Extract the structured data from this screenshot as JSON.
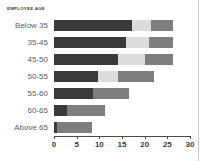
{
  "chart_data": {
    "type": "bar",
    "orientation": "horizontal",
    "stacked": true,
    "title": "EMPLOYEE AGE",
    "xlabel": "",
    "ylabel": "",
    "categories": [
      "Below 35",
      "35-45",
      "45-50",
      "50-55",
      "55-60",
      "60-65",
      "Above 65"
    ],
    "series": [
      {
        "name": "segment-1",
        "color": "#3a3a3a",
        "values": [
          17.1,
          15.8,
          14.2,
          9.8,
          8.7,
          2.9,
          0.7
        ]
      },
      {
        "name": "segment-2",
        "color": "#dcdcdc",
        "values": [
          4.2,
          5.1,
          5.8,
          4.4,
          0,
          0,
          0
        ]
      },
      {
        "name": "segment-3",
        "color": "#7e7e7e",
        "values": [
          4.9,
          5.3,
          6.2,
          7.8,
          7.8,
          8.4,
          7.7
        ]
      }
    ],
    "totals": [
      26.2,
      26.2,
      26.2,
      22.0,
      16.5,
      11.3,
      8.4
    ],
    "xticks": [
      0,
      5,
      10,
      15,
      20,
      25,
      30
    ],
    "xlim": [
      0,
      30
    ],
    "grid": false,
    "legend": "none"
  },
  "axis": {
    "tick_labels": [
      "0",
      "5",
      "10",
      "15",
      "20",
      "25",
      "30"
    ]
  },
  "colors": {
    "segment_1": "#3a3a3a",
    "segment_2": "#dcdcdc",
    "segment_3": "#7e7e7e",
    "axis": "#4a4a4a",
    "label_text": "#5d5d5d",
    "title_text": "#3b3b3b",
    "background": "#ffffff",
    "page_edge": "#c8c8c8"
  }
}
